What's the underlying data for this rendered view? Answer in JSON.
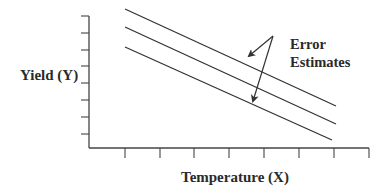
{
  "diagram": {
    "y_axis_label": "Yield (Y)",
    "x_axis_label": "Temperature (X)",
    "annotation": {
      "line1": "Error",
      "line2": "Estimates"
    },
    "colors": {
      "line": "#333333",
      "text": "#2a2a2a",
      "background": "#ffffff"
    }
  }
}
